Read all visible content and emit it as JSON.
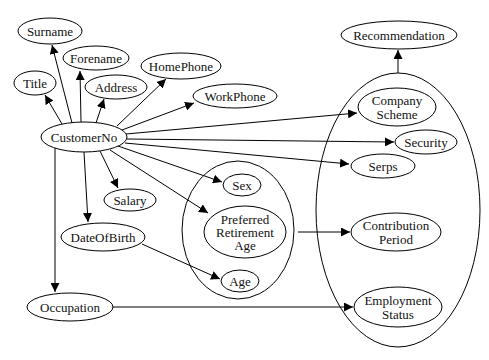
{
  "diagram": {
    "type": "directed-graph",
    "nodes": {
      "surname": "Surname",
      "forename": "Forename",
      "title": "Title",
      "address": "Address",
      "homephone": "HomePhone",
      "workphone": "WorkPhone",
      "customerno": "CustomerNo",
      "salary": "Salary",
      "dateofbirth": "DateOfBirth",
      "occupation": "Occupation",
      "recommendation": "Recommendation",
      "company_scheme": [
        "Company",
        "Scheme"
      ],
      "security": "Security",
      "serps": "Serps",
      "contribution_period": [
        "Contribution",
        "Period"
      ],
      "employment_status": [
        "Employment",
        "Status"
      ],
      "sex": "Sex",
      "preferred_retirement_age": [
        "Preferred",
        "Retirement",
        "Age"
      ],
      "age": "Age"
    },
    "clusters": [
      {
        "id": "personal-cluster",
        "members": [
          "Sex",
          "Preferred Retirement Age",
          "Age"
        ]
      },
      {
        "id": "pension-cluster",
        "members": [
          "Company Scheme",
          "Security",
          "Serps",
          "Contribution Period",
          "Employment Status"
        ]
      }
    ],
    "edges": [
      {
        "from": "CustomerNo",
        "to": "Surname"
      },
      {
        "from": "CustomerNo",
        "to": "Forename"
      },
      {
        "from": "CustomerNo",
        "to": "Title"
      },
      {
        "from": "CustomerNo",
        "to": "Address"
      },
      {
        "from": "CustomerNo",
        "to": "HomePhone"
      },
      {
        "from": "CustomerNo",
        "to": "WorkPhone"
      },
      {
        "from": "CustomerNo",
        "to": "Company Scheme"
      },
      {
        "from": "CustomerNo",
        "to": "Security"
      },
      {
        "from": "CustomerNo",
        "to": "Serps"
      },
      {
        "from": "CustomerNo",
        "to": "Sex"
      },
      {
        "from": "CustomerNo",
        "to": "Preferred Retirement Age"
      },
      {
        "from": "CustomerNo",
        "to": "Salary"
      },
      {
        "from": "CustomerNo",
        "to": "DateOfBirth"
      },
      {
        "from": "CustomerNo",
        "to": "Occupation"
      },
      {
        "from": "DateOfBirth",
        "to": "Age"
      },
      {
        "from": "personal-cluster",
        "to": "Contribution Period"
      },
      {
        "from": "Occupation",
        "to": "Employment Status"
      },
      {
        "from": "pension-cluster",
        "to": "Recommendation"
      }
    ]
  }
}
